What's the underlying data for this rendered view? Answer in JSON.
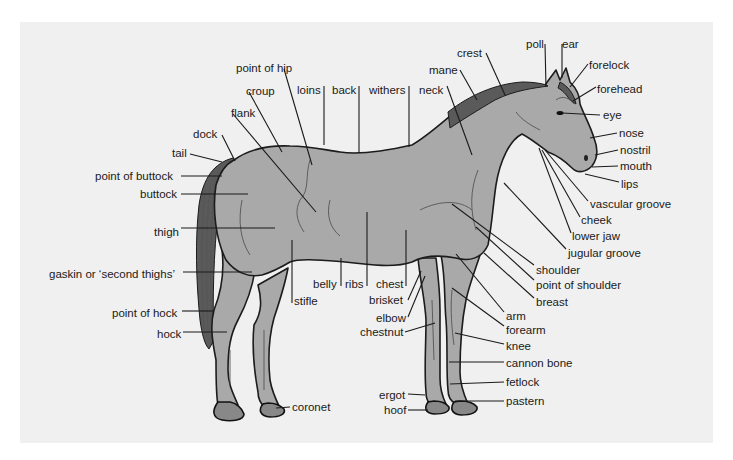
{
  "diagram": {
    "colors": {
      "panel": "#f0f0f0",
      "body": "#a9a9a9",
      "outline": "#1c1c1c",
      "text": "#1a1a1a"
    },
    "labels": [
      {
        "id": "point-of-hip",
        "text": "point of hip",
        "x": 236,
        "y": 72,
        "anchor": "start",
        "line": [
          [
            284,
            69
          ],
          [
            312,
            165
          ]
        ]
      },
      {
        "id": "croup",
        "text": "croup",
        "x": 246,
        "y": 95,
        "anchor": "start",
        "line": [
          [
            249,
            92
          ],
          [
            282,
            152
          ]
        ]
      },
      {
        "id": "flank",
        "text": "flank",
        "x": 231,
        "y": 117,
        "anchor": "start",
        "line": [
          [
            233,
            114
          ],
          [
            316,
            212
          ]
        ]
      },
      {
        "id": "dock",
        "text": "dock",
        "x": 193,
        "y": 138,
        "anchor": "start",
        "line": [
          [
            222,
            135
          ],
          [
            235,
            161
          ]
        ]
      },
      {
        "id": "tail",
        "text": "tail",
        "x": 172,
        "y": 157,
        "anchor": "start",
        "line": [
          [
            190,
            154
          ],
          [
            222,
            162
          ]
        ]
      },
      {
        "id": "point-of-buttock",
        "text": "point of buttock",
        "x": 95,
        "y": 180,
        "anchor": "start",
        "line": [
          [
            181,
            176
          ],
          [
            222,
            176
          ]
        ]
      },
      {
        "id": "buttock",
        "text": "buttock",
        "x": 140,
        "y": 198,
        "anchor": "start",
        "line": [
          [
            181,
            194
          ],
          [
            248,
            194
          ]
        ]
      },
      {
        "id": "thigh",
        "text": "thigh",
        "x": 154,
        "y": 236,
        "anchor": "start",
        "line": [
          [
            181,
            228
          ],
          [
            275,
            228
          ]
        ]
      },
      {
        "id": "gaskin",
        "text": "gaskin or ‘second thighs’",
        "x": 49,
        "y": 278,
        "anchor": "start",
        "line": [
          [
            183,
            272
          ],
          [
            252,
            272
          ]
        ]
      },
      {
        "id": "point-of-hock",
        "text": "point of hock",
        "x": 112,
        "y": 317,
        "anchor": "start",
        "line": [
          [
            182,
            311
          ],
          [
            213,
            311
          ]
        ]
      },
      {
        "id": "hock",
        "text": "hock",
        "x": 157,
        "y": 338,
        "anchor": "start",
        "line": [
          [
            183,
            332
          ],
          [
            227,
            332
          ]
        ]
      },
      {
        "id": "coronet",
        "text": "coronet",
        "x": 292,
        "y": 411,
        "anchor": "start",
        "line": [
          [
            290,
            407
          ],
          [
            276,
            408
          ]
        ]
      },
      {
        "id": "loins",
        "text": "loins",
        "x": 297,
        "y": 94,
        "anchor": "start",
        "line": [
          [
            324,
            86
          ],
          [
            324,
            145
          ]
        ]
      },
      {
        "id": "back",
        "text": "back",
        "x": 332,
        "y": 94,
        "anchor": "start",
        "line": [
          [
            359,
            86
          ],
          [
            359,
            153
          ]
        ]
      },
      {
        "id": "withers",
        "text": "withers",
        "x": 369,
        "y": 94,
        "anchor": "start",
        "line": [
          [
            409,
            86
          ],
          [
            409,
            147
          ]
        ]
      },
      {
        "id": "neck",
        "text": "neck",
        "x": 419,
        "y": 94,
        "anchor": "start",
        "line": [
          [
            447,
            86
          ],
          [
            472,
            155
          ]
        ]
      },
      {
        "id": "mane",
        "text": "mane",
        "x": 429,
        "y": 74,
        "anchor": "start",
        "line": [
          [
            460,
            70
          ],
          [
            477,
            100
          ]
        ]
      },
      {
        "id": "crest",
        "text": "crest",
        "x": 457,
        "y": 57,
        "anchor": "start",
        "line": [
          [
            486,
            53
          ],
          [
            505,
            95
          ]
        ]
      },
      {
        "id": "poll",
        "text": "poll",
        "x": 526,
        "y": 48,
        "anchor": "start",
        "line": [
          [
            545,
            44
          ],
          [
            546,
            87
          ]
        ]
      },
      {
        "id": "ear",
        "text": "ear",
        "x": 562,
        "y": 48,
        "anchor": "start",
        "line": [
          [
            562,
            44
          ],
          [
            562,
            78
          ]
        ]
      },
      {
        "id": "forelock",
        "text": "forelock",
        "x": 589,
        "y": 69,
        "anchor": "start",
        "line": [
          [
            588,
            64
          ],
          [
            570,
            87
          ]
        ]
      },
      {
        "id": "forehead",
        "text": "forehead",
        "x": 597,
        "y": 93,
        "anchor": "start",
        "line": [
          [
            596,
            87
          ],
          [
            573,
            101
          ]
        ]
      },
      {
        "id": "eye",
        "text": "eye",
        "x": 603,
        "y": 119,
        "anchor": "start",
        "line": [
          [
            600,
            115
          ],
          [
            562,
            113
          ]
        ]
      },
      {
        "id": "nose",
        "text": "nose",
        "x": 619,
        "y": 137,
        "anchor": "start",
        "line": [
          [
            617,
            133
          ],
          [
            590,
            138
          ]
        ]
      },
      {
        "id": "nostril",
        "text": "nostril",
        "x": 620,
        "y": 154,
        "anchor": "start",
        "line": [
          [
            618,
            150
          ],
          [
            595,
            155
          ]
        ]
      },
      {
        "id": "mouth",
        "text": "mouth",
        "x": 620,
        "y": 170,
        "anchor": "start",
        "line": [
          [
            618,
            166
          ],
          [
            592,
            167
          ]
        ]
      },
      {
        "id": "lips",
        "text": "lips",
        "x": 621,
        "y": 188,
        "anchor": "start",
        "line": [
          [
            619,
            182
          ],
          [
            585,
            174
          ]
        ]
      },
      {
        "id": "vascular-groove",
        "text": "vascular groove",
        "x": 590,
        "y": 208,
        "anchor": "start",
        "line": [
          [
            588,
            201
          ],
          [
            545,
            150
          ]
        ]
      },
      {
        "id": "cheek",
        "text": "cheek",
        "x": 581,
        "y": 224,
        "anchor": "start",
        "line": [
          [
            580,
            217
          ],
          [
            542,
            150
          ]
        ]
      },
      {
        "id": "lower-jaw",
        "text": "lower jaw",
        "x": 572,
        "y": 240,
        "anchor": "start",
        "line": [
          [
            571,
            233
          ],
          [
            539,
            148
          ]
        ]
      },
      {
        "id": "jugular-groove",
        "text": "jugular groove",
        "x": 568,
        "y": 257,
        "anchor": "start",
        "line": [
          [
            566,
            249
          ],
          [
            504,
            183
          ]
        ]
      },
      {
        "id": "shoulder",
        "text": "shoulder",
        "x": 536,
        "y": 274,
        "anchor": "start",
        "line": [
          [
            534,
            265
          ],
          [
            452,
            204
          ]
        ]
      },
      {
        "id": "point-of-shoulder",
        "text": "point of shoulder",
        "x": 536,
        "y": 289,
        "anchor": "start",
        "line": [
          [
            534,
            280
          ],
          [
            476,
            227
          ]
        ]
      },
      {
        "id": "breast",
        "text": "breast",
        "x": 536,
        "y": 306,
        "anchor": "start",
        "line": [
          [
            534,
            298
          ],
          [
            484,
            253
          ]
        ]
      },
      {
        "id": "arm",
        "text": "arm",
        "x": 506,
        "y": 320,
        "anchor": "start",
        "line": [
          [
            504,
            312
          ],
          [
            456,
            254
          ]
        ]
      },
      {
        "id": "forearm",
        "text": "forearm",
        "x": 506,
        "y": 334,
        "anchor": "start",
        "line": [
          [
            504,
            326
          ],
          [
            452,
            288
          ]
        ]
      },
      {
        "id": "knee",
        "text": "knee",
        "x": 506,
        "y": 350,
        "anchor": "start",
        "line": [
          [
            504,
            344
          ],
          [
            455,
            333
          ]
        ]
      },
      {
        "id": "cannon-bone",
        "text": "cannon bone",
        "x": 506,
        "y": 367,
        "anchor": "start",
        "line": [
          [
            504,
            362
          ],
          [
            449,
            362
          ]
        ]
      },
      {
        "id": "fetlock",
        "text": "fetlock",
        "x": 506,
        "y": 386,
        "anchor": "start",
        "line": [
          [
            504,
            382
          ],
          [
            450,
            384
          ]
        ]
      },
      {
        "id": "pastern",
        "text": "pastern",
        "x": 506,
        "y": 405,
        "anchor": "start",
        "line": [
          [
            504,
            401
          ],
          [
            455,
            401
          ]
        ]
      },
      {
        "id": "belly",
        "text": "belly",
        "x": 313,
        "y": 288,
        "anchor": "start",
        "line": [
          [
            341,
            286
          ],
          [
            341,
            258
          ]
        ]
      },
      {
        "id": "ribs",
        "text": "ribs",
        "x": 345,
        "y": 288,
        "anchor": "start",
        "line": [
          [
            367,
            286
          ],
          [
            367,
            212
          ]
        ]
      },
      {
        "id": "stifle",
        "text": "stifle",
        "x": 294,
        "y": 305,
        "anchor": "start",
        "line": [
          [
            292,
            303
          ],
          [
            292,
            240
          ]
        ]
      },
      {
        "id": "chest",
        "text": "chest",
        "x": 376,
        "y": 288,
        "anchor": "start",
        "line": [
          [
            406,
            286
          ],
          [
            406,
            230
          ]
        ]
      },
      {
        "id": "brisket",
        "text": "brisket",
        "x": 369,
        "y": 304,
        "anchor": "start",
        "line": [
          [
            408,
            300
          ],
          [
            421,
            271
          ]
        ]
      },
      {
        "id": "elbow",
        "text": "elbow",
        "x": 376,
        "y": 322,
        "anchor": "start",
        "line": [
          [
            408,
            317
          ],
          [
            425,
            276
          ]
        ]
      },
      {
        "id": "chestnut",
        "text": "chestnut",
        "x": 360,
        "y": 336,
        "anchor": "start",
        "line": [
          [
            405,
            332
          ],
          [
            435,
            323
          ]
        ]
      },
      {
        "id": "ergot",
        "text": "ergot",
        "x": 379,
        "y": 399,
        "anchor": "start",
        "line": [
          [
            408,
            394
          ],
          [
            425,
            395
          ]
        ]
      },
      {
        "id": "hoof",
        "text": "hoof",
        "x": 384,
        "y": 414,
        "anchor": "start",
        "line": [
          [
            408,
            410
          ],
          [
            428,
            410
          ]
        ]
      }
    ]
  }
}
